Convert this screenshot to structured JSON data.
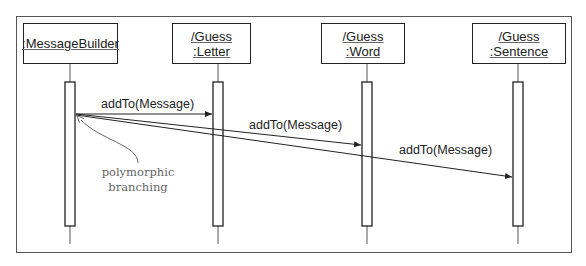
{
  "diagram": {
    "type": "UML sequence diagram",
    "objects": [
      {
        "line1": ":MessageBuilder",
        "line2": ""
      },
      {
        "line1": "/Guess",
        "line2": ":Letter"
      },
      {
        "line1": "/Guess",
        "line2": ":Word"
      },
      {
        "line1": "/Guess",
        "line2": ":Sentence"
      }
    ],
    "messages": [
      {
        "label": "addTo(Message)",
        "from": ":MessageBuilder",
        "to": "/Guess:Letter"
      },
      {
        "label": "addTo(Message)",
        "from": ":MessageBuilder",
        "to": "/Guess:Word"
      },
      {
        "label": "addTo(Message)",
        "from": ":MessageBuilder",
        "to": "/Guess:Sentence"
      }
    ],
    "annotation": {
      "line1": "polymorphic",
      "line2": "branching"
    },
    "colors": {
      "line": "#222222",
      "annotation": "#666666"
    }
  }
}
